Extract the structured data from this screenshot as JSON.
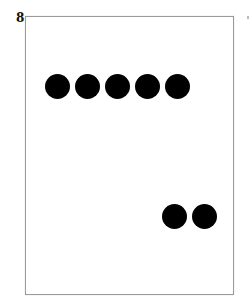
{
  "card": {
    "number": "8",
    "border_color": "#9a9a9a",
    "dot_color": "#000000",
    "dots": [
      {
        "group": "top-row",
        "cx": 57,
        "cy": 86
      },
      {
        "group": "top-row",
        "cx": 87,
        "cy": 86
      },
      {
        "group": "top-row",
        "cx": 117,
        "cy": 86
      },
      {
        "group": "top-row",
        "cx": 147,
        "cy": 86
      },
      {
        "group": "top-row",
        "cx": 177,
        "cy": 86
      },
      {
        "group": "bottom-pair",
        "cx": 174,
        "cy": 216
      },
      {
        "group": "bottom-pair",
        "cx": 204,
        "cy": 216
      }
    ],
    "dot_count": 7
  }
}
